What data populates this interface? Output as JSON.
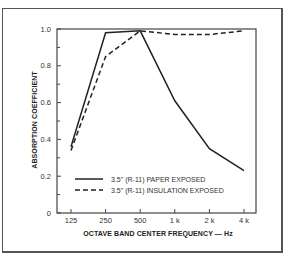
{
  "chart_data": {
    "type": "line",
    "title": "",
    "xlabel": "OCTAVE BAND CENTER FREQUENCY — Hz",
    "ylabel": "ABSORPTION COEFFICIENT",
    "categories": [
      "125",
      "250",
      "500",
      "1 k",
      "2 k",
      "4 k"
    ],
    "x_scale": "categorical",
    "ylim": [
      0,
      1.0
    ],
    "yticks": [
      0,
      0.2,
      0.4,
      0.6,
      0.8,
      1.0
    ],
    "ytick_labels": [
      "0",
      "0.2",
      "0.4",
      "0.6",
      "0.8",
      "1.0"
    ],
    "grid": false,
    "legend_position": "lower-center",
    "series": [
      {
        "name": "3.5\" (R-11) PAPER EXPOSED",
        "style": "solid",
        "color": "#222222",
        "values": [
          0.36,
          0.98,
          0.99,
          0.61,
          0.35,
          0.23
        ]
      },
      {
        "name": "3.5\" (R-11) INSULATION EXPOSED",
        "style": "dashed",
        "color": "#222222",
        "values": [
          0.34,
          0.85,
          0.99,
          0.97,
          0.97,
          0.99
        ]
      }
    ]
  }
}
